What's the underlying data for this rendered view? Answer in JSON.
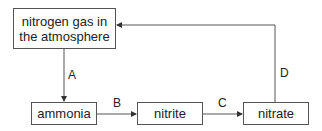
{
  "diagram": {
    "nodes": [
      {
        "id": "atmosphere",
        "label": "nitrogen gas in the atmosphere"
      },
      {
        "id": "ammonia",
        "label": "ammonia"
      },
      {
        "id": "nitrite",
        "label": "nitrite"
      },
      {
        "id": "nitrate",
        "label": "nitrate"
      }
    ],
    "edges": [
      {
        "from": "atmosphere",
        "to": "ammonia",
        "label": "A"
      },
      {
        "from": "ammonia",
        "to": "nitrite",
        "label": "B"
      },
      {
        "from": "nitrite",
        "to": "nitrate",
        "label": "C"
      },
      {
        "from": "nitrate",
        "to": "atmosphere",
        "label": "D"
      }
    ],
    "colors": {
      "line": "#555555",
      "text": "#222222",
      "background": "#ffffff"
    }
  }
}
